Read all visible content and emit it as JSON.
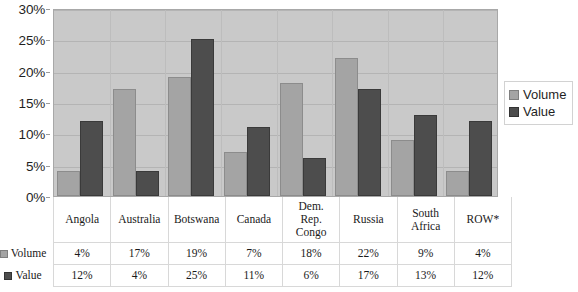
{
  "chart_data": {
    "type": "bar",
    "title": "",
    "subtitle": "",
    "xlabel": "",
    "ylabel": "",
    "ylim": [
      0,
      30
    ],
    "ytick_labels": [
      "0%",
      "5%",
      "10%",
      "15%",
      "20%",
      "25%",
      "30%"
    ],
    "ytick_values": [
      0,
      5,
      10,
      15,
      20,
      25,
      30
    ],
    "grid": true,
    "legend_position": "right",
    "categories": [
      "Angola",
      "Australia",
      "Botswana",
      "Canada",
      "Dem. Rep. Congo",
      "Russia",
      "South Africa",
      "ROW*"
    ],
    "series": [
      {
        "name": "Volume",
        "color": "#a4a4a4",
        "values": [
          4,
          17,
          19,
          7,
          18,
          22,
          9,
          4
        ],
        "labels": [
          "4%",
          "17%",
          "19%",
          "7%",
          "18%",
          "22%",
          "9%",
          "4%"
        ]
      },
      {
        "name": "Value",
        "color": "#4d4d4d",
        "values": [
          12,
          4,
          25,
          11,
          6,
          17,
          13,
          12
        ],
        "labels": [
          "12%",
          "4%",
          "25%",
          "11%",
          "6%",
          "17%",
          "13%",
          "12%"
        ]
      }
    ],
    "plot_background": "#c9c9c9",
    "gridline_color": "#b4b4b4"
  },
  "legend": {
    "items": [
      {
        "label": "Volume",
        "swatch": "volume-swatch-icon"
      },
      {
        "label": "Value",
        "swatch": "value-swatch-icon"
      }
    ]
  },
  "table": {
    "column_headers": [
      "Angola",
      "Australia",
      "Botswana",
      "Canada",
      "Dem.\nRep.\nCongo",
      "Russia",
      "South\nAfrica",
      "ROW*"
    ],
    "rows": [
      {
        "label": "Volume",
        "swatch": "volume-swatch-icon",
        "cells": [
          "4%",
          "17%",
          "19%",
          "7%",
          "18%",
          "22%",
          "9%",
          "4%"
        ]
      },
      {
        "label": "Value",
        "swatch": "value-swatch-icon",
        "cells": [
          "12%",
          "4%",
          "25%",
          "11%",
          "6%",
          "17%",
          "13%",
          "12%"
        ]
      }
    ]
  }
}
